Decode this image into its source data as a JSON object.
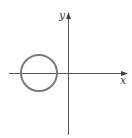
{
  "diagram": {
    "axes": {
      "x_label": "x",
      "y_label": "y"
    },
    "shapes": [
      {
        "type": "circle",
        "label": "",
        "position": "centered on negative x-axis, left of origin"
      }
    ],
    "colors": {
      "axis": "#555555",
      "circle": "#7a7a7a",
      "background": "#ffffff"
    }
  }
}
